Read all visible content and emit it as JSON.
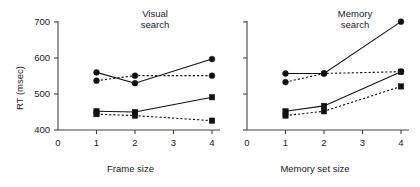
{
  "figure": {
    "background": "#ffffff",
    "ink_color": "#111111",
    "axis_color": "#444444"
  },
  "chart_data": [
    {
      "type": "line",
      "title": "Visual\nsearch",
      "xlabel": "Frame size",
      "ylabel": "RT (msec)",
      "x": [
        1,
        2,
        4
      ],
      "xtick_labels": [
        "0",
        "1",
        "2",
        "3",
        "4"
      ],
      "xtick_values": [
        0,
        1,
        2,
        3,
        4
      ],
      "ytick_labels": [
        "400",
        "500",
        "600",
        "700"
      ],
      "ytick_values": [
        400,
        500,
        600,
        700
      ],
      "ylim": [
        400,
        700
      ],
      "grid": false,
      "legend": "none",
      "series": [
        {
          "name": "circle-solid",
          "marker": "circle",
          "line": "solid",
          "values": [
            560,
            530,
            597
          ]
        },
        {
          "name": "circle-dashed",
          "marker": "circle",
          "line": "dashed",
          "values": [
            537,
            551,
            551
          ]
        },
        {
          "name": "square-solid",
          "marker": "square",
          "line": "solid",
          "values": [
            452,
            450,
            491
          ]
        },
        {
          "name": "square-dashed",
          "marker": "square",
          "line": "dashed",
          "values": [
            444,
            440,
            426
          ]
        }
      ]
    },
    {
      "type": "line",
      "title": "Memory\nsearch",
      "xlabel": "Memory set size",
      "ylabel": "RT (msec)",
      "x": [
        1,
        2,
        4
      ],
      "xtick_labels": [
        "0",
        "1",
        "2",
        "3",
        "4"
      ],
      "xtick_values": [
        0,
        1,
        2,
        3,
        4
      ],
      "ytick_labels": [
        "400",
        "500",
        "600",
        "700"
      ],
      "ytick_values": [
        400,
        500,
        600,
        700
      ],
      "ylim": [
        400,
        700
      ],
      "grid": false,
      "legend": "none",
      "series": [
        {
          "name": "circle-solid",
          "marker": "circle",
          "line": "solid",
          "values": [
            557,
            557,
            701
          ]
        },
        {
          "name": "circle-dashed",
          "marker": "circle",
          "line": "dashed",
          "values": [
            533,
            557,
            562
          ]
        },
        {
          "name": "square-solid",
          "marker": "square",
          "line": "solid",
          "values": [
            452,
            467,
            562
          ]
        },
        {
          "name": "square-dashed",
          "marker": "square",
          "line": "dashed",
          "values": [
            440,
            452,
            521
          ]
        }
      ]
    }
  ]
}
